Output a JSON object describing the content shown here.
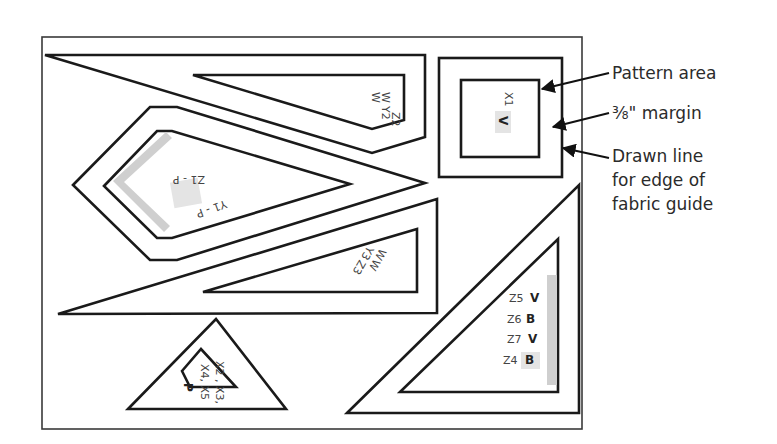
{
  "callouts": {
    "pattern_area": "Pattern area",
    "margin": "⅜\" margin",
    "drawn_line_1": "Drawn line",
    "drawn_line_2": "for edge of",
    "drawn_line_3": "fabric guide"
  },
  "pieces": {
    "top_wedge": {
      "labels": [
        "W",
        "W",
        "Y2",
        "Z2"
      ]
    },
    "square": {
      "label_code": "X1",
      "label_letter": "V"
    },
    "kite": {
      "label_a": "Z1 - P",
      "label_b": "Y1 - P"
    },
    "long_triangle": {
      "labels": [
        "W",
        "W",
        "Y3",
        "Z3"
      ]
    },
    "small_triangle": {
      "labels": [
        "X2 , X3,",
        "X4, X5",
        "P"
      ]
    },
    "right_triangle": {
      "rows": [
        {
          "code": "Z5",
          "letter": "V"
        },
        {
          "code": "Z6",
          "letter": "B"
        },
        {
          "code": "Z7",
          "letter": "V"
        },
        {
          "code": "Z4",
          "letter": "B"
        }
      ]
    }
  },
  "colors": {
    "line": "#1a1a1a",
    "highlight": "#cfcfcf",
    "highlight_light": "#e4e4e4",
    "background": "#ffffff"
  }
}
